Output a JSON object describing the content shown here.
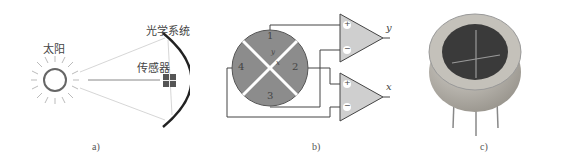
{
  "panel_a": {
    "sun_label": "太阳",
    "optics_label": "光学系统",
    "sensor_label": "传感器",
    "caption": "a)"
  },
  "panel_b": {
    "quadrants": [
      "1",
      "2",
      "3",
      "4"
    ],
    "axis_labels": {
      "y": "y",
      "x": "x"
    },
    "amp_top": {
      "plus": "+",
      "minus": "−",
      "output": "y"
    },
    "amp_bottom": {
      "plus": "+",
      "minus": "−",
      "output": "x"
    },
    "caption": "b)"
  },
  "panel_c": {
    "caption": "c)"
  },
  "colors": {
    "quadrant_fill": "#8c8c8c",
    "amp_fill": "#cfcfcf",
    "line": "#444444",
    "optics_arc": "#222222",
    "can_body": "#b3b0a8",
    "window": "#3a3a3a"
  }
}
